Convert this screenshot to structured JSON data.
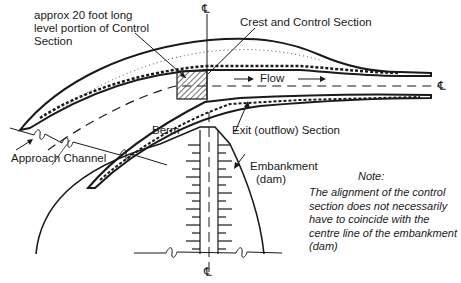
{
  "diagram": {
    "type": "plan view of spillway channel with control section through embankment",
    "labels": {
      "control_portion": [
        "approx 20 foot long",
        "level portion of Control",
        "Section"
      ],
      "crest": "Crest and Control Section",
      "flow": "Flow",
      "exit": "Exit (outflow) Section",
      "berm": "Berm",
      "approach": "Approach Channel",
      "embankment": [
        "Embankment",
        "(dam)"
      ],
      "centerline_symbol": "℄"
    },
    "note": {
      "title": "Note:",
      "lines": [
        "The alignment of the control",
        "section does not necessarily",
        "have to coincide with the",
        "centre line of the embankment",
        "(dam)"
      ]
    },
    "colors": {
      "ink": "#1a1a1a",
      "background": "#ffffff"
    }
  }
}
